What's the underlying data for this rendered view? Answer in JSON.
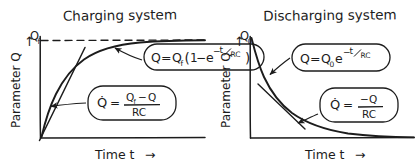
{
  "figure": {
    "background": "#ffffff",
    "ink": "#1c1c1c",
    "style": "hand-drawn-sketch"
  },
  "panels": [
    {
      "id": "charging",
      "title": "Charging system",
      "y_axis_label": "Parameter Q",
      "y_axis_arrow": "↑",
      "x_axis_label": "Time t",
      "x_axis_arrow": "→",
      "asymptote_label": "Q",
      "asymptote_sub": "f",
      "asymptote_dashed": true,
      "curve_type": "exponential-rise",
      "tangent_line": true,
      "callouts": [
        {
          "id": "charge-solution",
          "lhs": "Q",
          "eq": "=",
          "rhs_main": "Q",
          "rhs_sub": "f",
          "rhs_paren_open": "(",
          "rhs_one": "1",
          "rhs_minus": "−",
          "rhs_e": "e",
          "rhs_exp_minus": "−",
          "rhs_exp_num": "t",
          "rhs_exp_den": "RC",
          "rhs_paren_close": ")",
          "plain": "Q = Q_f(1 - e^(-t/RC))"
        },
        {
          "id": "charge-rate",
          "lhs": "Q̇",
          "eq": "=",
          "num_a": "Q",
          "num_a_sub": "f",
          "num_minus": "−",
          "num_b": "Q",
          "den": "RC",
          "plain": "Qdot = (Q_f - Q)/RC"
        }
      ]
    },
    {
      "id": "discharging",
      "title": "Discharging system",
      "y_axis_label": "Parameter Q",
      "y_axis_arrow": "↑",
      "x_axis_label": "Time t",
      "x_axis_arrow": "→",
      "start_label": "Q",
      "start_sub": "0",
      "asymptote_dashed": false,
      "curve_type": "exponential-decay",
      "tangent_line": true,
      "callouts": [
        {
          "id": "discharge-solution",
          "lhs": "Q",
          "eq": "=",
          "rhs_main": "Q",
          "rhs_sub": "0",
          "rhs_e": "e",
          "rhs_exp_minus": "−",
          "rhs_exp_num": "t",
          "rhs_exp_den": "RC",
          "plain": "Q = Q_0 e^(-t/RC)"
        },
        {
          "id": "discharge-rate",
          "lhs": "Q̇",
          "eq": "=",
          "num_minus": "−",
          "num_b": "Q",
          "den": "RC",
          "plain": "Qdot = -Q/RC"
        }
      ]
    }
  ]
}
